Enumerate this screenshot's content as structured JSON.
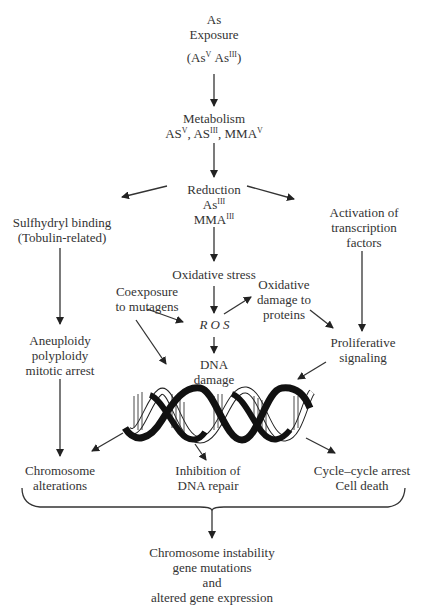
{
  "diagram": {
    "type": "flowchart",
    "topic": "Arsenic-induced genotoxicity pathways",
    "nodes": {
      "exposure": {
        "line1": "As",
        "line2": "Exposure",
        "species_a": "As",
        "species_a_sup": "V",
        "species_b": "As",
        "species_b_sup": "III"
      },
      "metabolism": {
        "title": "Metabolism",
        "s1": "AS",
        "s1_sup": "V",
        "s2": "AS",
        "s2_sup": "III",
        "s3": "MMA",
        "s3_sup": "V"
      },
      "reduction": {
        "title": "Reduction",
        "s1": "As",
        "s1_sup": "III",
        "s2": "MMA",
        "s2_sup": "III"
      },
      "sulfhydryl": {
        "line1": "Sulfhydryl binding",
        "line2": "(Tobulin-related)"
      },
      "activation": {
        "line1": "Activation of",
        "line2": "transcription",
        "line3": "factors"
      },
      "oxidative_stress": {
        "label": "Oxidative stress"
      },
      "coexposure": {
        "line1": "Coexposure",
        "line2": "to mutagens"
      },
      "oxidative_damage": {
        "line1": "Oxidative",
        "line2": "damage to",
        "line3": "proteins"
      },
      "ros": {
        "label": "ROS"
      },
      "dna_damage": {
        "line1": "DNA",
        "line2": "damage"
      },
      "aneuploidy": {
        "line1": "Aneuploidy",
        "line2": "polyploidy",
        "line3": "mitotic arrest"
      },
      "proliferative": {
        "line1": "Proliferative",
        "line2": "signaling"
      },
      "chromosome_alt": {
        "line1": "Chromosome",
        "line2": "alterations"
      },
      "inhibition": {
        "line1": "Inhibition of",
        "line2": "DNA repair"
      },
      "cycle_arrest": {
        "line1": "Cycle–cycle arrest",
        "line2": "Cell death"
      },
      "outcome": {
        "line1": "Chromosome instability",
        "line2": "gene mutations",
        "line3": "and",
        "line4": "altered gene expression"
      }
    },
    "edges": [
      [
        "exposure",
        "metabolism"
      ],
      [
        "metabolism",
        "reduction"
      ],
      [
        "reduction",
        "sulfhydryl"
      ],
      [
        "reduction",
        "activation"
      ],
      [
        "reduction",
        "oxidative_stress"
      ],
      [
        "oxidative_stress",
        "ros"
      ],
      [
        "coexposure",
        "ros"
      ],
      [
        "coexposure",
        "dna_helix"
      ],
      [
        "ros",
        "oxidative_damage"
      ],
      [
        "ros",
        "dna_damage"
      ],
      [
        "oxidative_damage",
        "proliferative"
      ],
      [
        "activation",
        "proliferative"
      ],
      [
        "proliferative",
        "dna_helix"
      ],
      [
        "sulfhydryl",
        "aneuploidy"
      ],
      [
        "aneuploidy",
        "chromosome_alt"
      ],
      [
        "dna_helix",
        "chromosome_alt"
      ],
      [
        "dna_helix",
        "inhibition"
      ],
      [
        "dna_helix",
        "cycle_arrest"
      ],
      [
        "brace_all_bottom",
        "outcome"
      ]
    ],
    "colors": {
      "text": "#333333",
      "lines": "#222222",
      "helix_dark": "#111111",
      "background": "#ffffff"
    }
  }
}
